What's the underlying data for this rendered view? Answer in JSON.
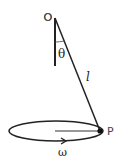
{
  "diagram": {
    "labels": {
      "pivot": "O",
      "angle": "θ",
      "length": "l",
      "bob": "P",
      "angular_velocity": "ω"
    },
    "colors": {
      "stroke": "#222222",
      "background": "#ffffff"
    }
  }
}
